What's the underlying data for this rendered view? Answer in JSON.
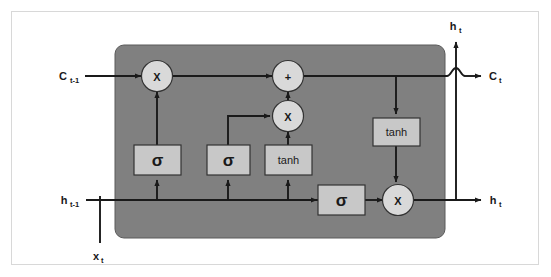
{
  "figure": {
    "background_color": "#ffffff",
    "border_color": "#d8d8d8",
    "panel_color": "#808080",
    "panel_border_color": "#4d4d4d",
    "box_fill_color": "#c8c8c8",
    "box_border_color": "#333333",
    "circle_fill_color": "#d9d9d9",
    "circle_border_color": "#333333",
    "line_color": "#1a1a1a"
  },
  "inputs": {
    "cell_state_prev": {
      "base": "C",
      "sub": "t-1",
      "full": "C t-1"
    },
    "hidden_prev": {
      "base": "h",
      "sub": "t-1",
      "full": "h t-1"
    },
    "input_x": {
      "base": "x",
      "sub": "t",
      "full": "x t"
    }
  },
  "outputs": {
    "cell_state_next": {
      "base": "C",
      "sub": "t",
      "full": "C t"
    },
    "hidden_next_top": {
      "base": "h",
      "sub": "t",
      "full": "h t"
    },
    "hidden_next_right": {
      "base": "h",
      "sub": "t",
      "full": "h t"
    }
  },
  "operators": [
    {
      "id": "forget-multiply",
      "symbol": "X",
      "cx": 157,
      "cy": 76
    },
    {
      "id": "cell-add",
      "symbol": "+",
      "cx": 288,
      "cy": 76
    },
    {
      "id": "input-multiply",
      "symbol": "X",
      "cx": 288,
      "cy": 116
    },
    {
      "id": "output-multiply",
      "symbol": "X",
      "cx": 398,
      "cy": 200
    }
  ],
  "gates": [
    {
      "id": "forget-gate",
      "label": "σ",
      "kind": "sigma",
      "x": 134,
      "y": 145,
      "w": 47,
      "h": 30
    },
    {
      "id": "input-gate",
      "label": "σ",
      "kind": "sigma",
      "x": 207,
      "y": 145,
      "w": 43,
      "h": 30
    },
    {
      "id": "candidate-gate",
      "label": "tanh",
      "kind": "tanh",
      "x": 265,
      "y": 145,
      "w": 47,
      "h": 30
    },
    {
      "id": "output-gate",
      "label": "σ",
      "kind": "sigma",
      "x": 318,
      "y": 185,
      "w": 47,
      "h": 30
    },
    {
      "id": "cell-tanh",
      "label": "tanh",
      "kind": "tanh",
      "x": 373,
      "y": 118,
      "w": 47,
      "h": 28
    }
  ],
  "panel": {
    "x": 115,
    "y": 45,
    "w": 330,
    "h": 193,
    "radius": 9
  }
}
